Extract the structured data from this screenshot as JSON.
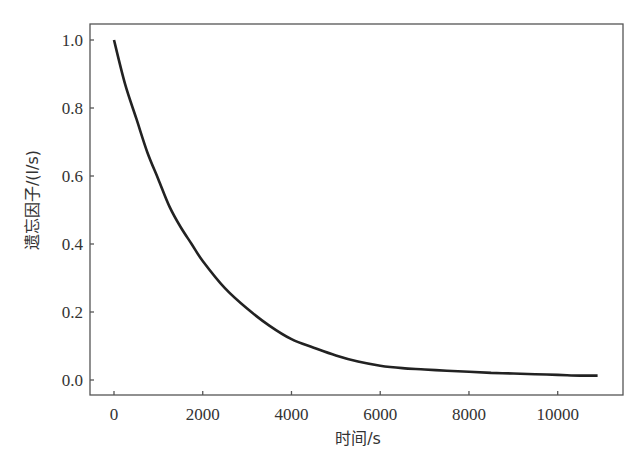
{
  "chart_data": {
    "type": "line",
    "title": "",
    "xlabel": "时间/s",
    "ylabel": "遗忘因子/(l/s)",
    "xlim": [
      -550,
      11500
    ],
    "ylim": [
      -0.045,
      1.05
    ],
    "x_ticks": [
      0,
      2000,
      4000,
      6000,
      8000,
      10000
    ],
    "x_tick_labels": [
      "0",
      "2000",
      "4000",
      "6000",
      "8000",
      "10000"
    ],
    "y_ticks": [
      0.0,
      0.2,
      0.4,
      0.6,
      0.8,
      1.0
    ],
    "y_tick_labels": [
      "0.0",
      "0.2",
      "0.4",
      "0.6",
      "0.8",
      "1.0"
    ],
    "grid": false,
    "legend": null,
    "series": [
      {
        "name": "遗忘因子",
        "color": "#222222",
        "x": [
          0,
          250,
          500,
          750,
          1000,
          1250,
          1500,
          1750,
          2000,
          2500,
          3000,
          3500,
          4000,
          4500,
          5000,
          5500,
          6000,
          6500,
          7000,
          7500,
          8000,
          8500,
          9000,
          9500,
          10000,
          10500,
          10900
        ],
        "values": [
          1.0,
          0.87,
          0.77,
          0.67,
          0.59,
          0.51,
          0.45,
          0.4,
          0.35,
          0.27,
          0.21,
          0.16,
          0.12,
          0.095,
          0.072,
          0.054,
          0.042,
          0.035,
          0.031,
          0.027,
          0.024,
          0.021,
          0.019,
          0.017,
          0.015,
          0.013,
          0.013
        ]
      }
    ]
  }
}
